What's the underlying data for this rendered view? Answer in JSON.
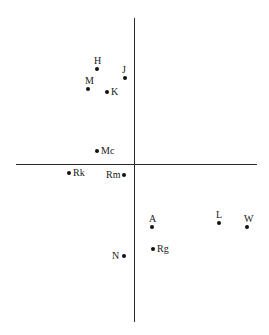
{
  "chart_data": {
    "type": "scatter",
    "title": "",
    "xlabel": "",
    "ylabel": "",
    "grid": false,
    "axes": {
      "horizontal": {
        "x1": 16,
        "x2": 257,
        "y": 164
      },
      "vertical": {
        "x": 134,
        "y1": 18,
        "y2": 322
      }
    },
    "points": [
      {
        "label": "H",
        "px": 97,
        "py": 69,
        "label_pos": "above"
      },
      {
        "label": "J",
        "px": 125,
        "py": 78,
        "label_pos": "above"
      },
      {
        "label": "M",
        "px": 88,
        "py": 89,
        "label_pos": "above"
      },
      {
        "label": "K",
        "px": 107,
        "py": 92,
        "label_pos": "right"
      },
      {
        "label": "Mc",
        "px": 97,
        "py": 151,
        "label_pos": "right"
      },
      {
        "label": "Rk",
        "px": 69,
        "py": 173,
        "label_pos": "right"
      },
      {
        "label": "Rm",
        "px": 124,
        "py": 175,
        "label_pos": "left"
      },
      {
        "label": "A",
        "px": 152,
        "py": 227,
        "label_pos": "above"
      },
      {
        "label": "L",
        "px": 219,
        "py": 223,
        "label_pos": "above"
      },
      {
        "label": "W",
        "px": 247,
        "py": 227,
        "label_pos": "above"
      },
      {
        "label": "Rg",
        "px": 153,
        "py": 249,
        "label_pos": "right"
      },
      {
        "label": "N",
        "px": 124,
        "py": 256,
        "label_pos": "left"
      }
    ]
  }
}
